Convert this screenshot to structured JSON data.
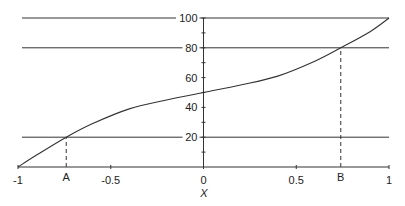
{
  "chart_data": {
    "type": "line",
    "title": "",
    "xlabel": "X",
    "ylabel": "",
    "xlim": [
      -1,
      1
    ],
    "ylim": [
      0,
      100
    ],
    "x_ticks": [
      -1,
      -0.5,
      0,
      0.5,
      1
    ],
    "x_tick_labels": [
      "-1",
      "-0.5",
      "0",
      "0.5",
      "1"
    ],
    "y_ticks": [
      20,
      40,
      60,
      80,
      100
    ],
    "y_tick_labels": [
      "20",
      "40",
      "60",
      "80",
      "100"
    ],
    "y_minor_tick_step": 10,
    "grid": false,
    "legend": null,
    "series": [
      {
        "name": "curve",
        "x": [
          -1,
          -0.9,
          -0.74,
          -0.6,
          -0.4,
          -0.2,
          0,
          0.2,
          0.4,
          0.6,
          0.74,
          0.9,
          1
        ],
        "values": [
          0,
          8,
          20,
          29,
          39,
          45,
          50,
          55,
          61,
          71,
          80,
          91,
          100
        ]
      }
    ],
    "reference_lines": {
      "horizontal": [
        {
          "y": 100,
          "style": "solid"
        },
        {
          "y": 80,
          "style": "solid"
        },
        {
          "y": 20,
          "style": "solid"
        }
      ],
      "vertical_dashed": [
        {
          "x": -0.74,
          "from_y": 0,
          "to_y": 20,
          "label": "A"
        },
        {
          "x": 0.74,
          "from_y": 0,
          "to_y": 80,
          "label": "B"
        }
      ]
    },
    "annotations": [
      "A",
      "B"
    ]
  },
  "colors": {
    "line": "#333333",
    "text": "#222222",
    "background": "#ffffff"
  }
}
